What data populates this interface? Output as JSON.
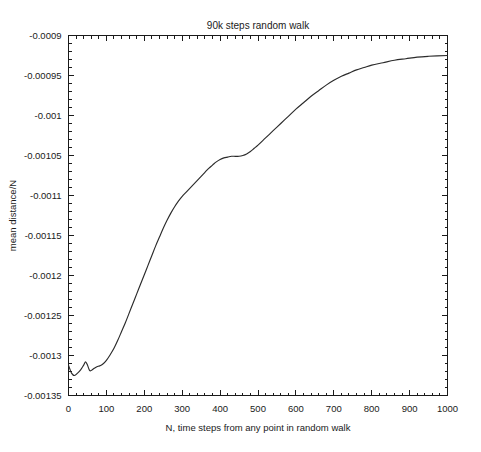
{
  "chart_data": {
    "type": "line",
    "title": "90k steps random walk",
    "xlabel": "N, time steps from any point in random walk",
    "ylabel": "mean distance/N",
    "xlim": [
      0,
      1000
    ],
    "ylim": [
      -0.00135,
      -0.0009
    ],
    "grid": false,
    "legend": null,
    "xticks": [
      0,
      100,
      200,
      300,
      400,
      500,
      600,
      700,
      800,
      900,
      1000
    ],
    "xtick_labels": [
      "0",
      "100",
      "200",
      "300",
      "400",
      "500",
      "600",
      "700",
      "800",
      "900",
      "1000"
    ],
    "yticks": [
      -0.0009,
      -0.00095,
      -0.001,
      -0.00105,
      -0.0011,
      -0.00115,
      -0.0012,
      -0.00125,
      -0.0013,
      -0.00135
    ],
    "ytick_labels": [
      "-0.0009",
      "-0.00095",
      "-0.001",
      "-0.00105",
      "-0.0011",
      "-0.00115",
      "-0.0012",
      "-0.00125",
      "-0.0013",
      "-0.00135"
    ],
    "minor_ticks_per_major": 5,
    "tick_direction": "in",
    "line_color": "#2b2b2b",
    "series": [
      {
        "name": "mean distance/N",
        "x": [
          0,
          8,
          16,
          24,
          32,
          40,
          45,
          50,
          56,
          62,
          68,
          75,
          82,
          90,
          100,
          110,
          120,
          130,
          140,
          150,
          160,
          170,
          180,
          190,
          200,
          210,
          220,
          230,
          240,
          250,
          260,
          270,
          280,
          290,
          300,
          310,
          320,
          330,
          340,
          350,
          360,
          370,
          380,
          390,
          400,
          410,
          420,
          430,
          440,
          450,
          460,
          470,
          480,
          490,
          500,
          520,
          540,
          560,
          580,
          600,
          620,
          640,
          660,
          680,
          700,
          720,
          740,
          760,
          780,
          800,
          830,
          860,
          890,
          920,
          950,
          1000
        ],
        "y": [
          -0.001312,
          -0.001322,
          -0.001325,
          -0.001322,
          -0.001318,
          -0.001312,
          -0.001308,
          -0.001312,
          -0.001319,
          -0.001318,
          -0.001316,
          -0.001314,
          -0.001313,
          -0.001311,
          -0.001306,
          -0.001299,
          -0.001291,
          -0.001281,
          -0.00127,
          -0.001259,
          -0.001247,
          -0.001235,
          -0.001223,
          -0.001211,
          -0.001199,
          -0.001187,
          -0.001175,
          -0.001163,
          -0.001152,
          -0.001141,
          -0.001131,
          -0.001122,
          -0.001114,
          -0.001107,
          -0.001101,
          -0.001096,
          -0.001091,
          -0.001086,
          -0.001081,
          -0.001076,
          -0.001071,
          -0.001066,
          -0.001062,
          -0.001058,
          -0.001055,
          -0.001053,
          -0.001052,
          -0.001051,
          -0.001051,
          -0.001051,
          -0.00105,
          -0.001048,
          -0.001045,
          -0.001041,
          -0.001037,
          -0.001028,
          -0.001019,
          -0.00101,
          -0.001001,
          -0.000992,
          -0.000984,
          -0.000976,
          -0.000969,
          -0.000962,
          -0.000956,
          -0.000951,
          -0.000947,
          -0.000943,
          -0.00094,
          -0.000937,
          -0.000934,
          -0.000931,
          -0.000929,
          -0.000927,
          -0.000926,
          -0.000925
        ]
      }
    ]
  }
}
